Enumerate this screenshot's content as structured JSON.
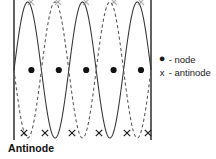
{
  "figure": {
    "background_color": "#ffffff",
    "width": 216,
    "height": 159
  },
  "caption": {
    "label": "Antinode"
  },
  "legend": {
    "items": [
      {
        "symbol": "●",
        "symbol_name": "filled-circle",
        "separator": "-",
        "label": "node",
        "text": "● - node"
      },
      {
        "symbol": "x",
        "symbol_name": "x-mark",
        "separator": "-",
        "label": "antinode",
        "text": "x - antinode"
      }
    ]
  },
  "chart_data": {
    "type": "line",
    "xlabel": "",
    "ylabel": "",
    "grid": false,
    "legend_position": "right",
    "axis_visible": false,
    "xlim": [
      0,
      5
    ],
    "ylim": [
      -1,
      1
    ],
    "boundaries": {
      "name": "fixed-ends-walls",
      "left_x": 14,
      "right_x": 151,
      "color": "#3a3a3a",
      "count": 2
    },
    "series": [
      {
        "name": "wave-solid",
        "style": "solid",
        "color": "#333333",
        "amplitude": 1,
        "half_wavelengths": 5,
        "phase": 0,
        "description": "solid standing-wave envelope, 5 half wavelengths between the walls"
      },
      {
        "name": "wave-dashed",
        "style": "dashed",
        "color": "#555555",
        "amplitude": 1,
        "half_wavelengths": 5,
        "phase": 180,
        "description": "dashed standing-wave envelope, inverted phase (half period later)"
      }
    ],
    "annotations": {
      "nodes": {
        "name": "node-markers",
        "marker": "filled-circle",
        "color": "#111111",
        "count": 5,
        "y_value": 0,
        "x_values": [
          1,
          2,
          3,
          4,
          5
        ],
        "pixel_y": 70,
        "pixel_x": [
          31.4,
          58.8,
          86.2,
          113.6,
          141.0
        ]
      },
      "antinodes_bottom": {
        "name": "antinode-markers-bottom",
        "marker": "x",
        "color": "#1a1a1a",
        "count": 6,
        "y_value": -1,
        "x_values": [
          0.5,
          1.5,
          2.5,
          3.5,
          4.5,
          5.5
        ],
        "pixel_y": 133,
        "pixel_x": [
          24,
          45,
          72,
          99,
          127,
          148
        ]
      },
      "antinodes_top": {
        "name": "antinode-markers-top",
        "marker": "x",
        "color": "#777777",
        "count": 5,
        "y_value": 1,
        "pixel_y": 2,
        "pixel_x": [
          31,
          58,
          86,
          114,
          141
        ]
      }
    }
  }
}
